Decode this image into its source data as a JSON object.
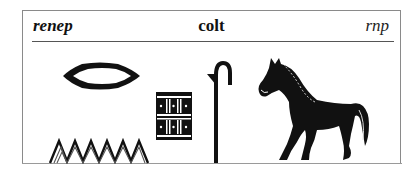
{
  "entry": {
    "transliteration": "renep",
    "gloss": "colt",
    "transliteration_short": "rnp"
  },
  "glyphs": [
    {
      "name": "mouth-glyph",
      "description": "r - mouth (lenticular shape)"
    },
    {
      "name": "water-glyph",
      "description": "n - water ripple (zigzag)"
    },
    {
      "name": "stool-glyph",
      "description": "p - reed mat/stool"
    },
    {
      "name": "staff-glyph",
      "description": "crook/staff determinative"
    },
    {
      "name": "horse-glyph",
      "description": "horse determinative"
    }
  ],
  "colors": {
    "ink": "#111111",
    "frame": "#8a8a8a",
    "background": "#ffffff"
  }
}
